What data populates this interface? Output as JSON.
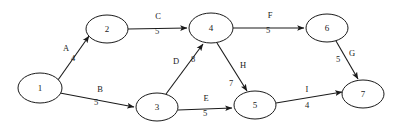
{
  "diagram": {
    "type": "directed-weighted-graph",
    "title": "",
    "background_color": "#ffffff",
    "stroke_color": "#1a1a1a",
    "nodes": [
      {
        "id": "1",
        "label": "1",
        "cx": 40,
        "cy": 88,
        "rx": 22,
        "ry": 15
      },
      {
        "id": "2",
        "label": "2",
        "cx": 107,
        "cy": 29,
        "rx": 21,
        "ry": 14
      },
      {
        "id": "3",
        "label": "3",
        "cx": 157,
        "cy": 107,
        "rx": 21,
        "ry": 14
      },
      {
        "id": "4",
        "label": "4",
        "cx": 211,
        "cy": 28,
        "rx": 22,
        "ry": 15
      },
      {
        "id": "5",
        "label": "5",
        "cx": 255,
        "cy": 105,
        "rx": 21,
        "ry": 14
      },
      {
        "id": "6",
        "label": "6",
        "cx": 327,
        "cy": 28,
        "rx": 21,
        "ry": 14
      },
      {
        "id": "7",
        "label": "7",
        "cx": 363,
        "cy": 94,
        "rx": 21,
        "ry": 14
      }
    ],
    "edges": [
      {
        "name": "A",
        "weight": "4",
        "from": "1",
        "to": "2",
        "x1": 58,
        "y1": 80,
        "x2": 89,
        "y2": 36,
        "label_x": 66,
        "label_y": 49,
        "weight_x": 73,
        "weight_y": 59,
        "directed": true
      },
      {
        "name": "B",
        "weight": "5",
        "from": "1",
        "to": "3",
        "x1": 60,
        "y1": 93,
        "x2": 134,
        "y2": 107,
        "label_x": 100,
        "label_y": 90,
        "weight_x": 96,
        "weight_y": 103,
        "directed": true
      },
      {
        "name": "C",
        "weight": "5",
        "from": "2",
        "to": "4",
        "x1": 128,
        "y1": 29,
        "x2": 187,
        "y2": 28,
        "label_x": 158,
        "label_y": 17,
        "weight_x": 157,
        "weight_y": 32,
        "directed": true
      },
      {
        "name": "D",
        "weight": "8",
        "from": "3",
        "to": "4",
        "x1": 166,
        "y1": 94,
        "x2": 203,
        "y2": 44,
        "label_x": 176,
        "label_y": 62,
        "weight_x": 193,
        "weight_y": 60,
        "directed": true
      },
      {
        "name": "E",
        "weight": "5",
        "from": "3",
        "to": "5",
        "x1": 178,
        "y1": 110,
        "x2": 232,
        "y2": 108,
        "label_x": 206,
        "label_y": 99,
        "weight_x": 205,
        "weight_y": 114,
        "directed": true
      },
      {
        "name": "F",
        "weight": "5",
        "from": "4",
        "to": "6",
        "x1": 233,
        "y1": 28,
        "x2": 304,
        "y2": 28,
        "label_x": 270,
        "label_y": 16,
        "weight_x": 268,
        "weight_y": 31,
        "directed": true
      },
      {
        "name": "G",
        "weight": "5",
        "from": "6",
        "to": "7",
        "x1": 336,
        "y1": 41,
        "x2": 358,
        "y2": 79,
        "label_x": 352,
        "label_y": 54,
        "weight_x": 338,
        "weight_y": 60,
        "directed": true
      },
      {
        "name": "H",
        "weight": "7",
        "from": "4",
        "to": "5",
        "x1": 217,
        "y1": 43,
        "x2": 247,
        "y2": 91,
        "label_x": 243,
        "label_y": 66,
        "weight_x": 231,
        "weight_y": 84,
        "directed": true
      },
      {
        "name": "I",
        "weight": "4",
        "from": "5",
        "to": "7",
        "x1": 276,
        "y1": 103,
        "x2": 342,
        "y2": 92,
        "label_x": 307,
        "label_y": 90,
        "weight_x": 307,
        "weight_y": 106,
        "directed": true
      }
    ]
  }
}
